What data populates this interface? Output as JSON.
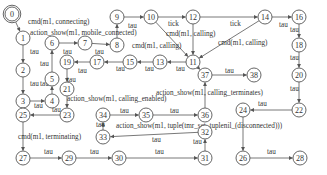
{
  "diagram": {
    "type": "state-transition-graph",
    "nodes": [
      {
        "id": "0",
        "x": 12,
        "y": 14,
        "initial": true
      },
      {
        "id": "1",
        "x": 23,
        "y": 38
      },
      {
        "id": "2",
        "x": 23,
        "y": 70
      },
      {
        "id": "3",
        "x": 23,
        "y": 101
      },
      {
        "id": "4",
        "x": 52,
        "y": 101
      },
      {
        "id": "5",
        "x": 52,
        "y": 79
      },
      {
        "id": "6",
        "x": 52,
        "y": 43
      },
      {
        "id": "7",
        "x": 85,
        "y": 43
      },
      {
        "id": "8",
        "x": 117,
        "y": 45
      },
      {
        "id": "9",
        "x": 117,
        "y": 17
      },
      {
        "id": "10",
        "x": 151,
        "y": 17
      },
      {
        "id": "11",
        "x": 193,
        "y": 62
      },
      {
        "id": "12",
        "x": 193,
        "y": 17
      },
      {
        "id": "13",
        "x": 160,
        "y": 62
      },
      {
        "id": "14",
        "x": 265,
        "y": 17
      },
      {
        "id": "15",
        "x": 130,
        "y": 62
      },
      {
        "id": "16",
        "x": 299,
        "y": 17
      },
      {
        "id": "17",
        "x": 97,
        "y": 62
      },
      {
        "id": "18",
        "x": 299,
        "y": 45
      },
      {
        "id": "19",
        "x": 67,
        "y": 62
      },
      {
        "id": "20",
        "x": 299,
        "y": 75
      },
      {
        "id": "21",
        "x": 67,
        "y": 89
      },
      {
        "id": "22",
        "x": 299,
        "y": 110
      },
      {
        "id": "23",
        "x": 67,
        "y": 115
      },
      {
        "id": "24",
        "x": 243,
        "y": 110
      },
      {
        "id": "25",
        "x": 23,
        "y": 115
      },
      {
        "id": "26",
        "x": 243,
        "y": 158
      },
      {
        "id": "27",
        "x": 23,
        "y": 158
      },
      {
        "id": "28",
        "x": 300,
        "y": 158
      },
      {
        "id": "29",
        "x": 69,
        "y": 158
      },
      {
        "id": "30",
        "x": 119,
        "y": 158
      },
      {
        "id": "31",
        "x": 205,
        "y": 158
      },
      {
        "id": "32",
        "x": 205,
        "y": 132
      },
      {
        "id": "33",
        "x": 103,
        "y": 137
      },
      {
        "id": "34",
        "x": 103,
        "y": 115
      },
      {
        "id": "35",
        "x": 146,
        "y": 115
      },
      {
        "id": "36",
        "x": 205,
        "y": 115
      },
      {
        "id": "37",
        "x": 205,
        "y": 75
      },
      {
        "id": "38",
        "x": 254,
        "y": 75
      }
    ],
    "edges": [
      {
        "from": "0",
        "to": "1",
        "label": "cmd(m1, connecting)"
      },
      {
        "from": "1",
        "to": "2",
        "label": "tau"
      },
      {
        "from": "2",
        "to": "3",
        "label": "tau"
      },
      {
        "from": "3",
        "to": "4",
        "label": ""
      },
      {
        "from": "4",
        "to": "5",
        "label": "tau"
      },
      {
        "from": "5",
        "to": "6",
        "label": "tau"
      },
      {
        "from": "6",
        "to": "7",
        "label": "tau"
      },
      {
        "from": "7",
        "to": "8",
        "label": "tau"
      },
      {
        "from": "8",
        "to": "9",
        "label": ""
      },
      {
        "from": "9",
        "to": "10",
        "label": "tau"
      },
      {
        "from": "10",
        "to": "12",
        "label": ""
      },
      {
        "from": "10",
        "to": "11",
        "label": "tick"
      },
      {
        "from": "12",
        "to": "11",
        "label": "cmd(m1, calling)"
      },
      {
        "from": "12",
        "to": "14",
        "label": "tick"
      },
      {
        "from": "14",
        "to": "11",
        "label": "cmd(m1, calling)"
      },
      {
        "from": "14",
        "to": "16",
        "label": "tau"
      },
      {
        "from": "16",
        "to": "18",
        "label": "tau"
      },
      {
        "from": "18",
        "to": "20",
        "label": "tau"
      },
      {
        "from": "20",
        "to": "22",
        "label": "tau"
      },
      {
        "from": "22",
        "to": "24",
        "label": "tau"
      },
      {
        "from": "24",
        "to": "26",
        "label": ""
      },
      {
        "from": "26",
        "to": "28",
        "label": "tau"
      },
      {
        "from": "11",
        "to": "13",
        "label": "tau"
      },
      {
        "from": "13",
        "to": "15",
        "label": "tau"
      },
      {
        "from": "15",
        "to": "17",
        "label": "tau"
      },
      {
        "from": "17",
        "to": "19",
        "label": "tau"
      },
      {
        "from": "19",
        "to": "21",
        "label": "tau"
      },
      {
        "from": "21",
        "to": "23",
        "label": "action_show(m1, calling_enabled)"
      },
      {
        "from": "23",
        "to": "25",
        "label": "tau"
      },
      {
        "from": "25",
        "to": "27",
        "label": "cmd(m1, terminating)"
      },
      {
        "from": "27",
        "to": "29",
        "label": "tau"
      },
      {
        "from": "29",
        "to": "30",
        "label": "tau"
      },
      {
        "from": "30",
        "to": "31",
        "label": "tau"
      },
      {
        "from": "31",
        "to": "32",
        "label": "tau"
      },
      {
        "from": "32",
        "to": "33",
        "label": "action_show(m1, tuple(tmr_set, tuplenil_(disconnected)))"
      },
      {
        "from": "33",
        "to": "34",
        "label": "tau"
      },
      {
        "from": "34",
        "to": "35",
        "label": "tau"
      },
      {
        "from": "35",
        "to": "36",
        "label": "tau"
      },
      {
        "from": "36",
        "to": "37",
        "label": "action_show(m1, calling_terminates)"
      },
      {
        "from": "37",
        "to": "38",
        "label": "tau"
      },
      {
        "from": "11",
        "to": "37",
        "label": ""
      }
    ],
    "labels": [
      {
        "text": "cmd(m1, connecting)",
        "x": 28,
        "y": 24
      },
      {
        "text": "action_show(m1, mobile_connected)",
        "x": 30,
        "y": 35
      },
      {
        "text": "tau",
        "x": 30,
        "y": 54
      },
      {
        "text": "tau",
        "x": 63,
        "y": 54
      },
      {
        "text": "tau",
        "x": 95,
        "y": 54
      },
      {
        "text": "tau",
        "x": 40,
        "y": 66
      },
      {
        "text": "tau",
        "x": 78,
        "y": 73
      },
      {
        "text": "tau",
        "x": 30,
        "y": 86
      },
      {
        "text": "tau",
        "x": 40,
        "y": 86
      },
      {
        "text": "tau",
        "x": 67,
        "y": 82
      },
      {
        "text": "tau",
        "x": 128,
        "y": 28
      },
      {
        "text": "tick",
        "x": 168,
        "y": 26
      },
      {
        "text": "cmd(m1, calling)",
        "x": 166,
        "y": 36
      },
      {
        "text": "cmd(m1, calling)",
        "x": 132,
        "y": 48
      },
      {
        "text": "tick",
        "x": 230,
        "y": 26
      },
      {
        "text": "cmd(m1, calling)",
        "x": 218,
        "y": 45
      },
      {
        "text": "tau",
        "x": 279,
        "y": 27
      },
      {
        "text": "tau",
        "x": 290,
        "y": 32
      },
      {
        "text": "tau",
        "x": 290,
        "y": 60
      },
      {
        "text": "tau",
        "x": 290,
        "y": 91
      },
      {
        "text": "tau",
        "x": 258,
        "y": 106
      },
      {
        "text": "tau",
        "x": 116,
        "y": 71
      },
      {
        "text": "tau",
        "x": 145,
        "y": 71
      },
      {
        "text": "tau",
        "x": 176,
        "y": 71
      },
      {
        "text": "tau",
        "x": 225,
        "y": 73
      },
      {
        "text": "action_show(m1, calling_terminates)",
        "x": 156,
        "y": 95
      },
      {
        "text": "action_show(m1, calling_enabled)",
        "x": 67,
        "y": 101
      },
      {
        "text": "tau",
        "x": 34,
        "y": 108
      },
      {
        "text": "tau",
        "x": 52,
        "y": 112
      },
      {
        "text": "tau",
        "x": 120,
        "y": 113
      },
      {
        "text": "tau",
        "x": 170,
        "y": 113
      },
      {
        "text": "tau",
        "x": 96,
        "y": 127
      },
      {
        "text": "action_show(m1, tuple(tmr_set, tuplenil_(disconnected)))",
        "x": 116,
        "y": 128
      },
      {
        "text": "tau",
        "x": 152,
        "y": 142
      },
      {
        "text": "tau",
        "x": 193,
        "y": 144
      },
      {
        "text": "cmd(m1, terminating)",
        "x": 18,
        "y": 139
      },
      {
        "text": "tau",
        "x": 44,
        "y": 154
      },
      {
        "text": "tau",
        "x": 90,
        "y": 154
      },
      {
        "text": "tau",
        "x": 155,
        "y": 154
      },
      {
        "text": "tau",
        "x": 267,
        "y": 154
      }
    ]
  }
}
